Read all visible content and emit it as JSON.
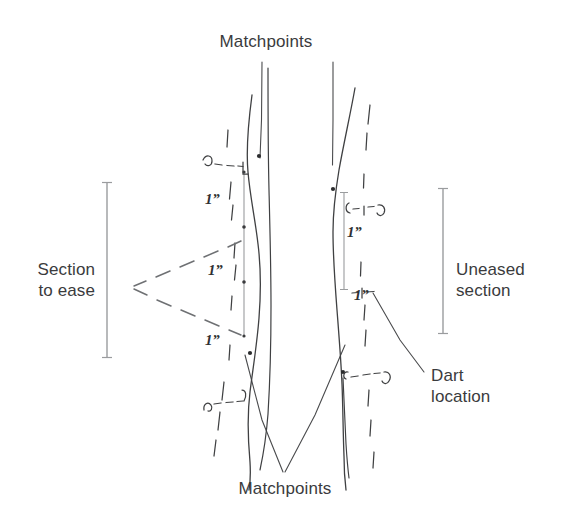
{
  "figure": {
    "title_top": "Matchpoints",
    "title_bottom": "Matchpoints",
    "background_color": "#ffffff",
    "ink_color": "#3a3b3d",
    "sketch_color": "#4a4b4d",
    "guide_color": "#8e9093"
  },
  "labels": {
    "matchpoints_top": "Matchpoints",
    "matchpoints_bottom": "Matchpoints",
    "section_to_ease": "Section\nto ease",
    "uneased_section": "Uneased\nsection",
    "dart_location": "Dart\nlocation"
  },
  "dimensions": {
    "left_column": [
      {
        "id": "left-dim-1",
        "text": "1”"
      },
      {
        "id": "left-dim-2",
        "text": "1”"
      },
      {
        "id": "left-dim-3",
        "text": "1”"
      }
    ],
    "right_column": [
      {
        "id": "right-dim-1",
        "text": "1”"
      },
      {
        "id": "right-dim-2",
        "text": "1”"
      }
    ]
  },
  "brackets": {
    "left": {
      "name": "section-to-ease-bracket",
      "top": 182,
      "bottom": 358,
      "x": 107
    },
    "right": {
      "name": "uneased-section-bracket",
      "top": 188,
      "bottom": 334,
      "x": 443
    }
  }
}
